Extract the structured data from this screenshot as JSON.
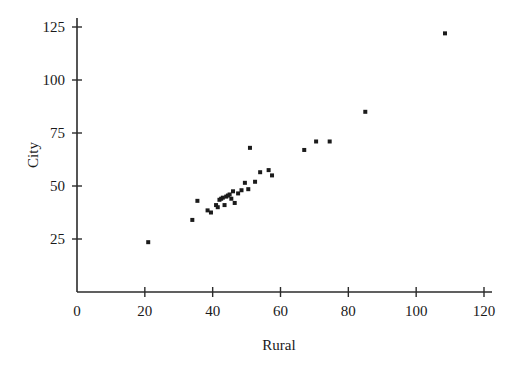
{
  "chart_data": {
    "type": "scatter",
    "title": "",
    "xlabel": "Rural",
    "ylabel": "City",
    "xlim": [
      0,
      120
    ],
    "ylim": [
      0,
      131
    ],
    "xticks": [
      0,
      20,
      40,
      60,
      80,
      100,
      120
    ],
    "xtick_labels": [
      "0",
      "20",
      "40",
      "60",
      "80",
      "100",
      "120"
    ],
    "yticks": [
      25,
      50,
      75,
      100,
      125
    ],
    "ytick_labels": [
      "25",
      "50",
      "75",
      "100",
      "125"
    ],
    "grid": false,
    "legend": null,
    "marker": "square",
    "marker_color": "#1b1b1b",
    "marker_size": 3,
    "series": [
      {
        "name": "observations",
        "x": [
          21.0,
          34.0,
          35.5,
          38.5,
          39.5,
          41.0,
          41.5,
          42.0,
          42.5,
          43.0,
          43.5,
          44.0,
          44.5,
          45.0,
          45.5,
          46.0,
          46.5,
          47.5,
          48.5,
          49.5,
          50.5,
          51.0,
          52.5,
          54.0,
          56.5,
          57.5,
          67.0,
          70.5,
          74.5,
          85.0,
          108.5
        ],
        "y": [
          23.5,
          34.0,
          43.0,
          38.5,
          37.5,
          41.0,
          40.0,
          43.5,
          44.0,
          44.5,
          41.0,
          45.0,
          45.5,
          46.0,
          44.0,
          47.5,
          42.0,
          46.5,
          48.0,
          51.5,
          48.5,
          68.0,
          52.0,
          56.5,
          57.5,
          55.0,
          67.0,
          71.0,
          71.0,
          85.0,
          122.0
        ]
      }
    ]
  },
  "axes": {
    "x_title": "Rural",
    "y_title": "City"
  }
}
